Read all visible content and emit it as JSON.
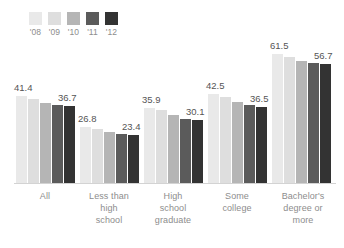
{
  "legend": {
    "position": "top-left",
    "entries": [
      {
        "label": "'08",
        "color": "#e9e9e9",
        "name": "legend-swatch-2008"
      },
      {
        "label": "'09",
        "color": "#dedede",
        "name": "legend-swatch-2009"
      },
      {
        "label": "'10",
        "color": "#b5b5b5",
        "name": "legend-swatch-2010"
      },
      {
        "label": "'11",
        "color": "#5b5b5b",
        "name": "legend-swatch-2011"
      },
      {
        "label": "'12",
        "color": "#333333",
        "name": "legend-swatch-2012"
      }
    ]
  },
  "axis": {
    "baseline_color": "#d3d3d3",
    "label_color": "#8d8d8d",
    "value_label_color": "#555555"
  },
  "chart_data": {
    "type": "bar",
    "title": "",
    "subtitle": "",
    "xlabel": "",
    "ylabel": "",
    "grid": false,
    "legend_position": "top-left",
    "ylim": [
      0,
      70
    ],
    "categories": [
      "All",
      "Less than high school",
      "High school graduate",
      "Some college",
      "Bachelor's degree or more"
    ],
    "category_lines": [
      [
        "All"
      ],
      [
        "Less than",
        "high",
        "school"
      ],
      [
        "High",
        "school",
        "graduate"
      ],
      [
        "Some",
        "college"
      ],
      [
        "Bachelor's",
        "degree or",
        "more"
      ]
    ],
    "series": [
      {
        "name": "'08",
        "color": "#e9e9e9",
        "values": [
          41.4,
          26.8,
          35.9,
          42.5,
          61.5
        ]
      },
      {
        "name": "'09",
        "color": "#dedede",
        "values": [
          40.3,
          25.9,
          34.8,
          41.3,
          60.1
        ]
      },
      {
        "name": "'10",
        "color": "#b5b5b5",
        "values": [
          38.5,
          24.6,
          32.5,
          38.9,
          58.4
        ]
      },
      {
        "name": "'11",
        "color": "#5b5b5b",
        "values": [
          37.2,
          23.8,
          30.8,
          37.2,
          57.3
        ]
      },
      {
        "name": "'12",
        "color": "#333333",
        "values": [
          36.7,
          23.4,
          30.1,
          36.5,
          56.7
        ]
      }
    ],
    "annotations": [
      {
        "category": "All",
        "series": "'08",
        "text": "41.4"
      },
      {
        "category": "All",
        "series": "'12",
        "text": "36.7"
      },
      {
        "category": "Less than high school",
        "series": "'08",
        "text": "26.8"
      },
      {
        "category": "Less than high school",
        "series": "'12",
        "text": "23.4"
      },
      {
        "category": "High school graduate",
        "series": "'08",
        "text": "35.9"
      },
      {
        "category": "High school graduate",
        "series": "'12",
        "text": "30.1"
      },
      {
        "category": "Some college",
        "series": "'08",
        "text": "42.5"
      },
      {
        "category": "Some college",
        "series": "'12",
        "text": "36.5"
      },
      {
        "category": "Bachelor's degree or more",
        "series": "'08",
        "text": "61.5"
      },
      {
        "category": "Bachelor's degree or more",
        "series": "'12",
        "text": "56.7"
      }
    ]
  },
  "groups": [
    {
      "name": "All",
      "left": 16,
      "label_left": 8,
      "label_width": 74,
      "first_value": "41.4",
      "last_value": "36.7",
      "lines": [
        "All"
      ]
    },
    {
      "name": "Less than high school",
      "left": 80,
      "label_left": 72,
      "label_width": 74,
      "first_value": "26.8",
      "last_value": "23.4",
      "lines": [
        "Less than",
        "high",
        "school"
      ]
    },
    {
      "name": "High school graduate",
      "left": 144,
      "label_left": 136,
      "label_width": 74,
      "first_value": "35.9",
      "last_value": "30.1",
      "lines": [
        "High",
        "school",
        "graduate"
      ]
    },
    {
      "name": "Some college",
      "left": 208,
      "label_left": 200,
      "label_width": 74,
      "first_value": "42.5",
      "last_value": "36.5",
      "lines": [
        "Some",
        "college"
      ]
    },
    {
      "name": "Bachelor's degree or more",
      "left": 272,
      "label_left": 264,
      "label_width": 78,
      "first_value": "61.5",
      "last_value": "56.7",
      "lines": [
        "Bachelor's",
        "degree or",
        "more"
      ]
    }
  ]
}
